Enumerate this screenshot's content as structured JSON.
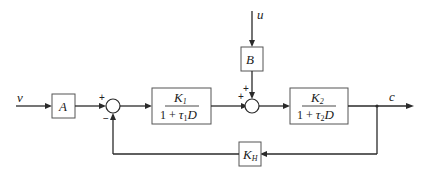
{
  "diagram": {
    "type": "block-diagram",
    "title": "",
    "inputs": {
      "v": "v",
      "u": "u"
    },
    "output": "c",
    "blocks": {
      "A": {
        "label": "A"
      },
      "B": {
        "label": "B"
      },
      "G1": {
        "num_main": "K",
        "num_sub": "1",
        "den_prefix": "1 + ",
        "den_tau": "τ",
        "den_sub": "1",
        "den_suffix": "D"
      },
      "G2": {
        "num_main": "K",
        "num_sub": "2",
        "den_prefix": "1 + ",
        "den_tau": "τ",
        "den_sub": "2",
        "den_suffix": "D"
      },
      "KH": {
        "main": "K",
        "sub": "H"
      }
    },
    "summing_junctions": {
      "S1": {
        "sign_top_left": "+",
        "sign_bottom": "−"
      },
      "S2": {
        "sign_left": "+",
        "sign_top": "+"
      }
    },
    "connections": [
      "v → A",
      "A → S1(+)",
      "S1 → G1",
      "G1 → S2(+)",
      "u → B",
      "B → S2(+)",
      "S2 → G2",
      "G2 → c",
      "c → KH",
      "KH → S1(−)"
    ]
  }
}
